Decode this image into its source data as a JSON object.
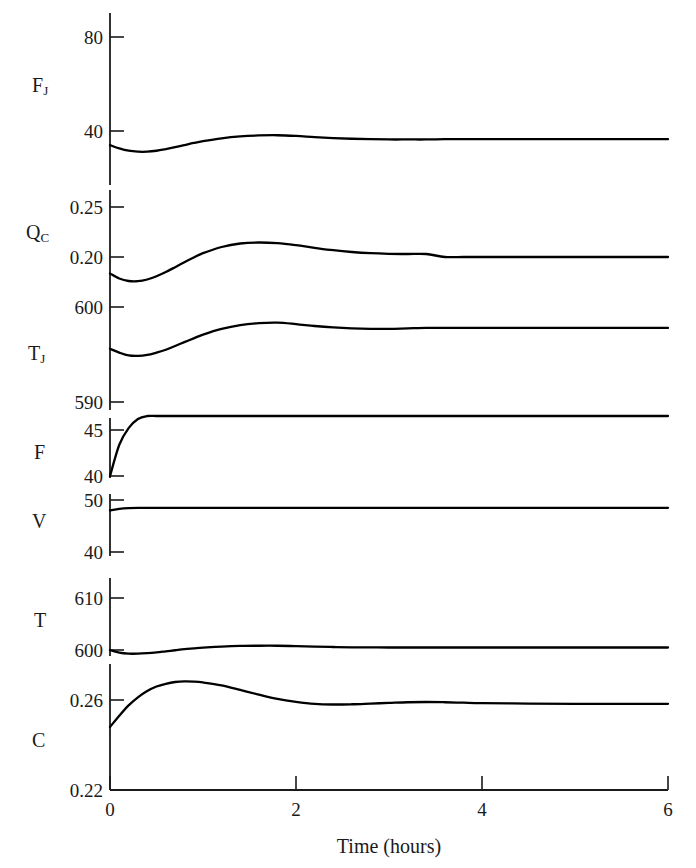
{
  "figure": {
    "xlabel": "Time (hours)",
    "xticks": [
      "0",
      "2",
      "4",
      "6"
    ],
    "xtick_values": [
      0,
      2,
      4,
      6
    ],
    "xlim": [
      0,
      6
    ],
    "line_color": "#000000",
    "axis_color": "#1a1a1a"
  },
  "panels": [
    {
      "var_label": "F",
      "var_sub": "J",
      "yticks": [
        "80",
        "40"
      ],
      "ytick_values": [
        80,
        40
      ]
    },
    {
      "var_label": "Q",
      "var_sub": "C",
      "yticks": [
        "0.25",
        "0.20"
      ],
      "ytick_values": [
        0.25,
        0.2
      ]
    },
    {
      "var_label": "T",
      "var_sub": "J",
      "yticks": [
        "600",
        "590"
      ],
      "ytick_values": [
        600,
        590
      ]
    },
    {
      "var_label": "F",
      "var_sub": "",
      "yticks": [
        "45",
        "40"
      ],
      "ytick_values": [
        45,
        40
      ]
    },
    {
      "var_label": "V",
      "var_sub": "",
      "yticks": [
        "50",
        "40"
      ],
      "ytick_values": [
        50,
        40
      ]
    },
    {
      "var_label": "T",
      "var_sub": "",
      "yticks": [
        "610",
        "600"
      ],
      "ytick_values": [
        610,
        600
      ]
    },
    {
      "var_label": "C",
      "var_sub": "",
      "yticks": [
        "0.26",
        "0.22"
      ],
      "ytick_values": [
        0.26,
        0.22
      ]
    }
  ],
  "chart_data": {
    "type": "line",
    "title": "",
    "xlabel": "Time (hours)",
    "ylabel": "",
    "xlim": [
      0,
      6
    ],
    "grid": false,
    "legend": "none",
    "layout": "7 stacked panels sharing one time axis",
    "x": [
      0,
      0.1,
      0.2,
      0.3,
      0.4,
      0.5,
      0.6,
      0.7,
      0.8,
      0.9,
      1.0,
      1.2,
      1.4,
      1.6,
      1.8,
      2.0,
      2.2,
      2.4,
      2.6,
      2.8,
      3.0,
      3.2,
      3.4,
      3.6,
      3.8,
      4.0,
      4.5,
      5.0,
      5.5,
      6.0
    ],
    "series": [
      {
        "name": "F_J",
        "panel": 0,
        "ylim": [
          20,
          90
        ],
        "yticks": [
          80,
          40
        ],
        "units": "",
        "values": [
          34.0,
          32.6,
          31.6,
          31.2,
          31.2,
          31.6,
          32.3,
          33.1,
          34.0,
          34.9,
          35.7,
          36.9,
          37.7,
          38.1,
          38.2,
          37.9,
          37.4,
          37.0,
          36.7,
          36.5,
          36.4,
          36.4,
          36.4,
          36.5,
          36.5,
          36.5,
          36.5,
          36.5,
          36.5,
          36.5
        ]
      },
      {
        "name": "Q_C",
        "panel": 1,
        "ylim": [
          0.165,
          0.265
        ],
        "yticks": [
          0.25,
          0.2
        ],
        "units": "",
        "values": [
          0.1835,
          0.1785,
          0.176,
          0.1758,
          0.1775,
          0.1808,
          0.185,
          0.1898,
          0.1948,
          0.1995,
          0.2038,
          0.21,
          0.2135,
          0.2145,
          0.2138,
          0.2118,
          0.2092,
          0.2068,
          0.205,
          0.2038,
          0.2032,
          0.203,
          0.203,
          0.2,
          0.2,
          0.2,
          0.2,
          0.2,
          0.2,
          0.2
        ]
      },
      {
        "name": "T_J",
        "panel": 2,
        "ylim": [
          588,
          602
        ],
        "yticks": [
          600,
          590
        ],
        "units": "",
        "values": [
          595.6,
          595.2,
          594.9,
          594.85,
          594.95,
          595.2,
          595.5,
          595.9,
          596.3,
          596.7,
          597.1,
          597.7,
          598.1,
          598.3,
          598.35,
          598.2,
          598.0,
          597.85,
          597.75,
          597.7,
          597.7,
          597.75,
          597.8,
          597.8,
          597.8,
          597.8,
          597.8,
          597.8,
          597.8,
          597.8
        ]
      },
      {
        "name": "F",
        "panel": 3,
        "ylim": [
          39.5,
          47
        ],
        "yticks": [
          45,
          40
        ],
        "units": "",
        "values": [
          40.0,
          43.4,
          45.2,
          46.2,
          46.8,
          47.1,
          47.3,
          47.4,
          47.45,
          47.5,
          47.5,
          47.5,
          47.5,
          47.5,
          47.5,
          47.5,
          47.5,
          47.5,
          47.5,
          47.5,
          47.5,
          47.5,
          47.5,
          47.5,
          47.5,
          47.5,
          47.5,
          47.5,
          47.5,
          47.5
        ]
      },
      {
        "name": "V",
        "panel": 4,
        "ylim": [
          38,
          52
        ],
        "yticks": [
          50,
          40
        ],
        "units": "",
        "values": [
          48.0,
          48.3,
          48.45,
          48.5,
          48.5,
          48.5,
          48.5,
          48.5,
          48.5,
          48.5,
          48.5,
          48.5,
          48.5,
          48.5,
          48.5,
          48.5,
          48.5,
          48.5,
          48.5,
          48.5,
          48.5,
          48.5,
          48.5,
          48.5,
          48.5,
          48.5,
          48.5,
          48.5,
          48.5,
          48.5
        ]
      },
      {
        "name": "T",
        "panel": 5,
        "ylim": [
          596.5,
          612
        ],
        "yticks": [
          610,
          600
        ],
        "units": "",
        "values": [
          600.0,
          599.5,
          599.3,
          599.3,
          599.4,
          599.55,
          599.75,
          599.95,
          600.15,
          600.3,
          600.45,
          600.65,
          600.78,
          600.82,
          600.82,
          600.75,
          600.65,
          600.58,
          600.52,
          600.5,
          600.48,
          600.48,
          600.48,
          600.48,
          600.48,
          600.48,
          600.48,
          600.48,
          600.48,
          600.48
        ]
      },
      {
        "name": "C",
        "panel": 6,
        "ylim": [
          0.215,
          0.272
        ],
        "yticks": [
          0.26,
          0.22
        ],
        "units": "",
        "values": [
          0.248,
          0.253,
          0.2576,
          0.2612,
          0.264,
          0.266,
          0.2672,
          0.268,
          0.2683,
          0.2682,
          0.2678,
          0.2665,
          0.2645,
          0.2624,
          0.2605,
          0.2592,
          0.2583,
          0.258,
          0.2581,
          0.2584,
          0.2587,
          0.259,
          0.2591,
          0.259,
          0.2588,
          0.2586,
          0.2584,
          0.2583,
          0.2583,
          0.2583
        ]
      }
    ]
  }
}
